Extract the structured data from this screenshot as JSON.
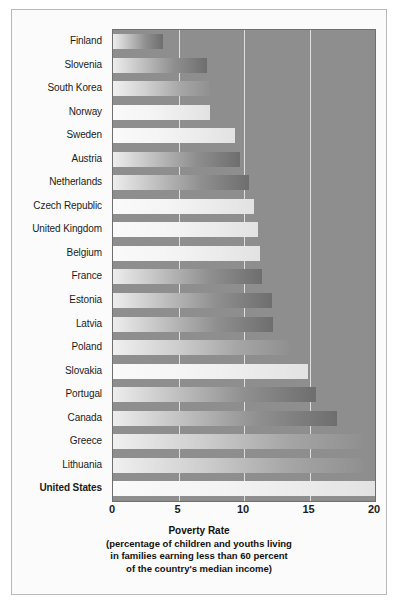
{
  "chart_data": {
    "type": "bar",
    "orientation": "horizontal",
    "title": "",
    "xlabel": "Poverty Rate",
    "xlabel_sub": [
      "(percentage of children and youths living",
      "in families earning less than 60 percent",
      "of the country's median income)"
    ],
    "ylabel": "",
    "xlim": [
      0,
      20
    ],
    "xticks": [
      0,
      5,
      10,
      15,
      20
    ],
    "xtick_labels": [
      "0",
      "5",
      "10",
      "15",
      "20"
    ],
    "grid": true,
    "grid_axis": "x",
    "legend": false,
    "categories": [
      "Finland",
      "Slovenia",
      "South Korea",
      "Norway",
      "Sweden",
      "Austria",
      "Netherlands",
      "Czech Republic",
      "United Kingdom",
      "Belgium",
      "France",
      "Estonia",
      "Latvia",
      "Poland",
      "Slovakia",
      "Portugal",
      "Canada",
      "Greece",
      "Lithuania",
      "United States"
    ],
    "values": [
      3.8,
      7.2,
      7.4,
      7.4,
      9.3,
      9.7,
      10.4,
      10.8,
      11.1,
      11.2,
      11.4,
      12.1,
      12.2,
      13.4,
      14.9,
      15.5,
      17.1,
      18.9,
      19.1,
      20.0
    ],
    "highlighted_category": "United States",
    "bar_styles": [
      "dark",
      "dark",
      "mid",
      "pale",
      "pale",
      "dark",
      "dark",
      "pale",
      "pale",
      "pale",
      "dark",
      "dark",
      "dark",
      "mid",
      "pale",
      "dark",
      "dark",
      "mid",
      "mid",
      "pale"
    ],
    "plot_background": "#8e8e8e",
    "gridline_color": "#ededed",
    "figure_background": "#fbfbfb",
    "frame_color": "#b9b9b9"
  }
}
